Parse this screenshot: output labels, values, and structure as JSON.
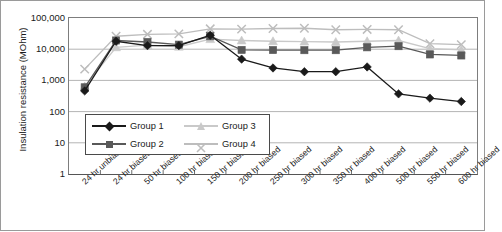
{
  "chart_data": {
    "type": "line",
    "title": "",
    "xlabel": "",
    "ylabel": "Insulation resistance (MOhm)",
    "yscale": "log",
    "ylim": [
      1,
      100000
    ],
    "yticks": [
      "100,000",
      "10,000",
      "1,000",
      "100",
      "10",
      "1"
    ],
    "ytick_values": [
      100000,
      10000,
      1000,
      100,
      10,
      1
    ],
    "grid": true,
    "legend_position": "inside-lower-left",
    "categories": [
      "24 hr unbiased",
      "24 hr biased",
      "50 hr biased",
      "100 hr biased",
      "150 hr biased",
      "200 hr biased",
      "250 hr biased",
      "300 hr biased",
      "350 hr biased",
      "400 hr biased",
      "500 hr biased",
      "550 hr biased",
      "600 hr biased"
    ],
    "series": [
      {
        "name": "Group 1",
        "marker": "diamond",
        "color": "#1a1a1a",
        "values": [
          460,
          18000,
          13000,
          13000,
          28000,
          4800,
          2500,
          1900,
          1900,
          2700,
          370,
          270,
          210
        ]
      },
      {
        "name": "Group 2",
        "marker": "square",
        "color": "#595959",
        "values": [
          600,
          19000,
          17000,
          14000,
          26000,
          9500,
          9400,
          9300,
          9300,
          11500,
          12500,
          6800,
          6300
        ]
      },
      {
        "name": "Group 3",
        "marker": "triangle",
        "color": "#c9c9c9",
        "values": [
          640,
          11500,
          13500,
          12000,
          21000,
          19000,
          18000,
          17500,
          17000,
          18000,
          19000,
          10500,
          9500
        ]
      },
      {
        "name": "Group 4",
        "marker": "x",
        "color": "#bdbdbd",
        "values": [
          2300,
          26000,
          30000,
          31000,
          45000,
          44000,
          46000,
          47000,
          42000,
          43000,
          42000,
          15000,
          14000
        ]
      }
    ]
  },
  "legend": {
    "entries": [
      {
        "label": "Group 1"
      },
      {
        "label": "Group 2"
      },
      {
        "label": "Group 3"
      },
      {
        "label": "Group 4"
      }
    ]
  },
  "colors": {
    "group1": "#1a1a1a",
    "group2": "#595959",
    "group3": "#c9c9c9",
    "group4": "#bdbdbd",
    "grid": "#b4b4b4",
    "axis": "#555555",
    "frame": "#9a9a9a"
  }
}
